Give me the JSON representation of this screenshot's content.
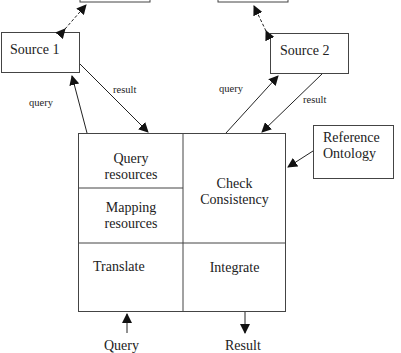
{
  "diagram": {
    "nodes": {
      "top_left_box": {
        "label": ""
      },
      "top_right_box": {
        "label": ""
      },
      "source1": {
        "label": "Source 1"
      },
      "source2": {
        "label": "Source 2"
      },
      "reference_ontology": {
        "line1": "Reference",
        "line2": "Ontology"
      },
      "mediator": {
        "query_resources": {
          "line1": "Query",
          "line2": "resources"
        },
        "mapping_resources": {
          "line1": "Mapping",
          "line2": "resources"
        },
        "check_consistency": {
          "line1": "Check",
          "line2": "Consistency"
        },
        "translate": {
          "label": "Translate"
        },
        "integrate": {
          "label": "Integrate"
        }
      }
    },
    "edge_labels": {
      "source1_query": "query",
      "source1_result": "result",
      "source2_query": "query",
      "source2_result": "result"
    },
    "io": {
      "input": "Query",
      "output": "Result"
    },
    "colors": {
      "stroke": "#444444",
      "text": "#222222",
      "background": "#ffffff"
    }
  }
}
